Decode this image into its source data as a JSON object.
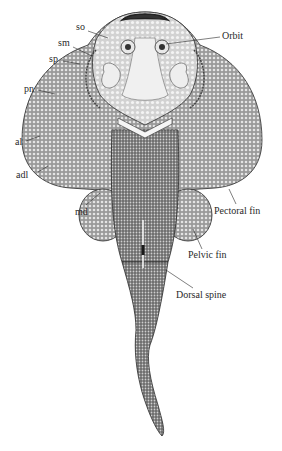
{
  "figure": {
    "colors": {
      "ink": "#2a2a2a",
      "fill_dark": "#6b6b6b",
      "fill_mid": "#8d8d8d",
      "fill_light": "#d9d9d9",
      "head_light": "#e6e6e6",
      "background": "#ffffff"
    },
    "labels": {
      "so": "so",
      "sm": "sm",
      "sp": "sp",
      "pn": "pn",
      "al": "al",
      "adl": "adl",
      "md": "md",
      "orbit": "Orbit",
      "pectoral_fin": "Pectoral fin",
      "pelvic_fin": "Pelvic fin",
      "dorsal_spine": "Dorsal spine"
    }
  }
}
